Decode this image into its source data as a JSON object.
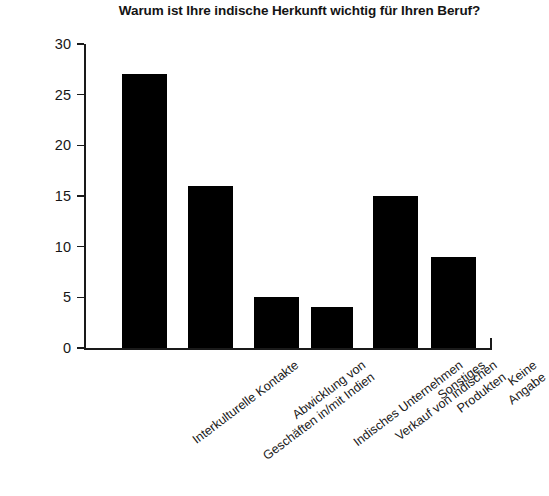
{
  "chart_data": {
    "type": "bar",
    "title": "Warum ist Ihre indische Herkunft wichtig für Ihren Beruf?",
    "xlabel": "",
    "ylabel": "",
    "ylim": [
      0,
      30
    ],
    "yticks": [
      0,
      5,
      10,
      15,
      20,
      25,
      30
    ],
    "ytick_labels": [
      "0",
      "5",
      "10",
      "15",
      "20",
      "25",
      "30"
    ],
    "grid": false,
    "legend": false,
    "bar_color": "#000000",
    "categories": [
      "Interkulturelle Kontakte",
      "Abwicklung von\nGeschäften in/mit Indien",
      "Indisches Unternehmen",
      "Verkauf von indischen\nProdukten",
      "Sonstiges",
      "Keine Angabe"
    ],
    "values": [
      27,
      16,
      5,
      4,
      15,
      9
    ]
  }
}
